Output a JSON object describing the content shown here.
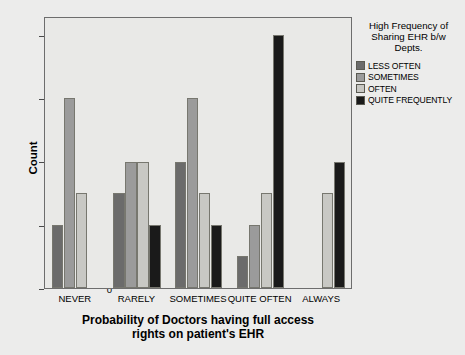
{
  "chart_data": {
    "type": "bar",
    "title": "",
    "xlabel": "Probability of Doctors having full access rights on patient's EHR",
    "xlabel_lines": [
      "Probability of Doctors having full access",
      "rights on patient's EHR"
    ],
    "ylabel": "Count",
    "ylim": [
      0,
      8.6
    ],
    "yticks": [
      0,
      2,
      4,
      6,
      8
    ],
    "ytick_labels": [
      "0",
      "2",
      "4",
      "6",
      "8"
    ],
    "grid": false,
    "legend_position": "right",
    "legend_title": "High Frequency of Sharing EHR b/w Depts.",
    "legend_title_lines": [
      "High Frequency of",
      "Sharing EHR b/w",
      "Depts."
    ],
    "categories": [
      "NEVER",
      "RARELY",
      "SOMETIMES",
      "QUITE OFTEN",
      "ALWAYS"
    ],
    "series": [
      {
        "name": "LESS OFTEN",
        "color": "#6b6b6b",
        "values": [
          2,
          3,
          4,
          1,
          0
        ]
      },
      {
        "name": "SOMETIMES",
        "color": "#9b9b9b",
        "values": [
          6,
          4,
          6,
          2,
          0
        ]
      },
      {
        "name": "OFTEN",
        "color": "#c8c8c4",
        "values": [
          3,
          4,
          3,
          3,
          3
        ]
      },
      {
        "name": "QUITE FREQUENTLY",
        "color": "#1a1a1a",
        "values": [
          0,
          2,
          2,
          8,
          4
        ]
      }
    ],
    "plot_background": "#e9e9e7",
    "page_background": "#ececeb",
    "axis_color": "#6d6d6d"
  }
}
